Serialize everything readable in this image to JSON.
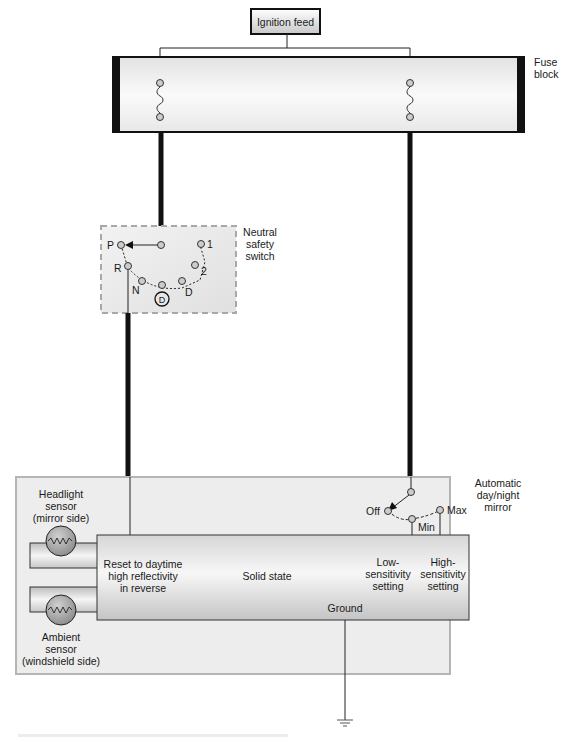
{
  "diagram": {
    "ignition_feed": {
      "label": "Ignition feed"
    },
    "fuse_block": {
      "label_lines": [
        "Fuse",
        "block"
      ],
      "fuse_count": 2
    },
    "neutral_safety_switch": {
      "label_lines": [
        "Neutral",
        "safety",
        "switch"
      ],
      "positions": [
        "P",
        "R",
        "N",
        "D",
        "2",
        "1"
      ],
      "overdrive_label": "D",
      "selected_position": "P"
    },
    "mirror": {
      "label_lines": [
        "Automatic",
        "day/night",
        "mirror"
      ],
      "sensitivity_switch": {
        "positions": [
          "Off",
          "Min",
          "Max"
        ],
        "selected_position": "Off"
      },
      "module": {
        "reset_text": [
          "Reset to daytime",
          "high reflectivity",
          "in reverse"
        ],
        "center_text": "Solid state",
        "low_text": [
          "Low-",
          "sensitivity",
          "setting"
        ],
        "high_text": [
          "High-",
          "sensitivity",
          "setting"
        ],
        "ground_text": "Ground"
      },
      "headlight_sensor": {
        "label_lines": [
          "Headlight",
          "sensor",
          "(mirror side)"
        ]
      },
      "ambient_sensor": {
        "label_lines": [
          "Ambient",
          "sensor",
          "(windshield side)"
        ]
      }
    },
    "ground_symbol": "ground-icon"
  },
  "colors": {
    "wire_heavy": "#111111",
    "panel_fill": "#ededed",
    "panel_border": "#b5b5b5",
    "switch_border": "#a8a8a8",
    "sensor_fill": "#9a9a9a"
  }
}
